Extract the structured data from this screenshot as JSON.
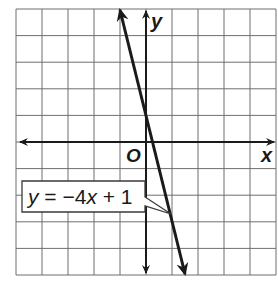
{
  "chart_data": {
    "type": "line",
    "title": "",
    "xlabel": "x",
    "ylabel": "y",
    "origin_label": "O",
    "xlim": [
      -5,
      5
    ],
    "ylim": [
      -5,
      5
    ],
    "grid": true,
    "grid_step": 1,
    "series": [
      {
        "name": "y = −4x + 1",
        "equation": "y = -4x + 1",
        "slope": -4,
        "intercept": 1,
        "x": [
          -1,
          0,
          1,
          1.5
        ],
        "y": [
          5,
          1,
          -3,
          -5
        ],
        "arrows": "both"
      }
    ],
    "annotations": [
      {
        "text": "y = −4x + 1",
        "points_to": [
          1,
          -3
        ]
      }
    ],
    "legend": "none"
  },
  "labels": {
    "x_axis": "x",
    "y_axis": "y",
    "origin": "O",
    "eq_y": "y",
    "eq_rest": " = −4",
    "eq_x": "x",
    "eq_tail": " + 1"
  },
  "colors": {
    "grid": "#6f6f6f",
    "axis": "#1a1a1a",
    "line": "#1a1a1a",
    "background": "#ffffff"
  }
}
